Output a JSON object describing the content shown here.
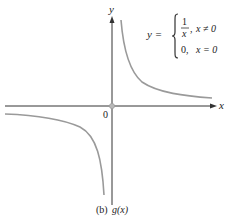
{
  "figure": {
    "caption_prefix": "(b)",
    "caption_func": "g(x)",
    "axes": {
      "x_label": "x",
      "y_label": "y",
      "origin_label": "0"
    },
    "definition": {
      "lhs": "y =",
      "case1_num": "1",
      "case1_den": "x",
      "case1_sep": ",",
      "case1_cond": "x ≠ 0",
      "case2_val": "0,",
      "case2_cond": "x = 0"
    },
    "colors": {
      "axis": "#333333",
      "curve": "#9a9a9a",
      "point": "#b0b0b0",
      "text": "#222222"
    }
  }
}
